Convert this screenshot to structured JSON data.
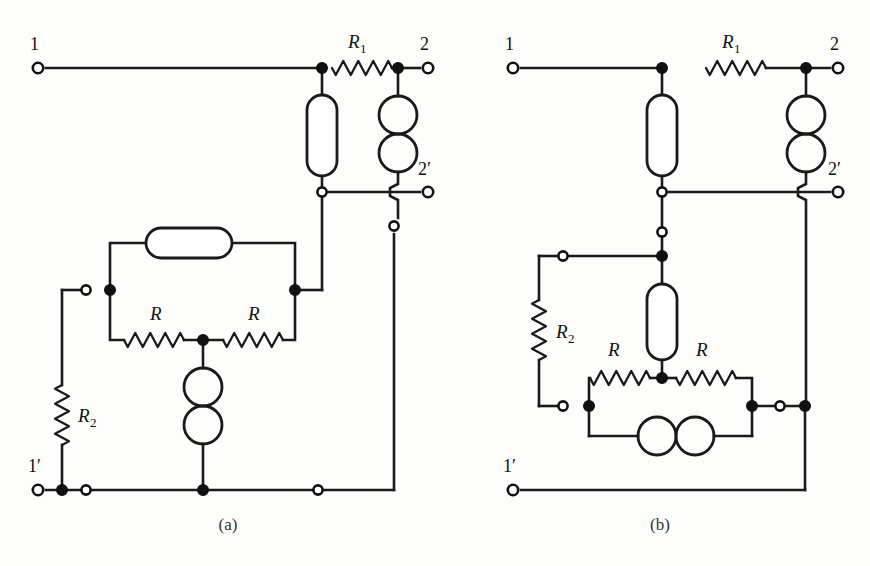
{
  "figure": {
    "background_color": "#fdfdfc",
    "ink_color": "#1a1a1a",
    "width": 870,
    "height": 566,
    "panels": [
      {
        "id": "panel-a",
        "caption": "(a)",
        "caption_x": 228,
        "caption_y": 530,
        "terminals": [
          {
            "name": "terminal-1",
            "label": "1",
            "cx": 38,
            "cy": 68,
            "label_x": 30,
            "label_y": 50
          },
          {
            "name": "terminal-2",
            "label": "2",
            "cx": 428,
            "cy": 68,
            "label_x": 420,
            "label_y": 50
          },
          {
            "name": "terminal-2p",
            "label": "2′",
            "cx": 428,
            "cy": 192,
            "label_x": 418,
            "label_y": 175
          },
          {
            "name": "terminal-1p",
            "label": "1′",
            "cx": 38,
            "cy": 490,
            "label_x": 28,
            "label_y": 472
          }
        ],
        "components": [
          {
            "name": "resistor-r1",
            "type": "resistor",
            "orientation": "h",
            "x1": 332,
            "y1": 68,
            "x2": 392,
            "y2": 68,
            "label": "R",
            "sub": "1",
            "label_x": 348,
            "label_y": 48
          },
          {
            "name": "inductor-upper",
            "type": "inductor-stadium",
            "orientation": "v",
            "cx": 322,
            "y1": 95,
            "y2": 176,
            "w": 30
          },
          {
            "name": "capacitor-upper",
            "type": "capacitor-double-circle",
            "orientation": "v",
            "cx": 398,
            "y1": 96,
            "y2": 172
          },
          {
            "name": "inductor-middle",
            "type": "inductor-stadium",
            "orientation": "h",
            "cy": 243,
            "x1": 146,
            "x2": 232,
            "w": 30
          },
          {
            "name": "resistor-r-left",
            "type": "resistor",
            "orientation": "h",
            "x1": 124,
            "y1": 340,
            "x2": 184,
            "y2": 340,
            "label": "R",
            "sub": "",
            "label_x": 150,
            "label_y": 320
          },
          {
            "name": "resistor-r-right",
            "type": "resistor",
            "orientation": "h",
            "x1": 223,
            "y1": 340,
            "x2": 283,
            "y2": 340,
            "label": "R",
            "sub": "",
            "label_x": 248,
            "label_y": 320
          },
          {
            "name": "resistor-r2",
            "type": "resistor",
            "orientation": "v",
            "x1": 62,
            "y1": 385,
            "x2": 62,
            "y2": 445,
            "label": "R",
            "sub": "2",
            "label_x": 78,
            "label_y": 422
          },
          {
            "name": "capacitor-lower",
            "type": "capacitor-double-circle",
            "orientation": "v",
            "cx": 203,
            "y1": 368,
            "y2": 444
          }
        ],
        "nodes": [
          {
            "name": "node-a-top-left-junction",
            "type": "filled",
            "cx": 322,
            "cy": 68
          },
          {
            "name": "node-a-top-right-junction",
            "type": "filled",
            "cx": 398,
            "cy": 68
          },
          {
            "name": "node-a-mid-left-open",
            "type": "open",
            "cx": 322,
            "cy": 192
          },
          {
            "name": "node-a-2p-stub-open",
            "type": "open",
            "cx": 394,
            "cy": 226
          },
          {
            "name": "node-a-bridge-left-open",
            "type": "open",
            "cx": 86,
            "cy": 290
          },
          {
            "name": "node-a-bridge-left-dot",
            "type": "filled",
            "cx": 110,
            "cy": 290
          },
          {
            "name": "node-a-bridge-right-dot",
            "type": "filled",
            "cx": 295,
            "cy": 290
          },
          {
            "name": "node-a-center-dot",
            "type": "filled",
            "cx": 203,
            "cy": 340
          },
          {
            "name": "node-a-bottom-left-dot",
            "type": "filled",
            "cx": 62,
            "cy": 490
          },
          {
            "name": "node-a-bottom-left-open",
            "type": "open",
            "cx": 86,
            "cy": 490
          },
          {
            "name": "node-a-bottom-center-dot",
            "type": "filled",
            "cx": 203,
            "cy": 490
          },
          {
            "name": "node-a-bottom-right-open",
            "type": "open",
            "cx": 318,
            "cy": 490
          }
        ],
        "wires": [
          {
            "name": "wire-a-top-rail-in",
            "d": "M 46 68 L 322 68"
          },
          {
            "name": "wire-a-r1-to-node2",
            "d": "M 392 68 L 420 68"
          },
          {
            "name": "wire-a-node1-to-ind",
            "d": "M 322 68 L 322 95"
          },
          {
            "name": "wire-a-node2-to-cap",
            "d": "M 398 68 L 398 96"
          },
          {
            "name": "wire-a-ind-to-open",
            "d": "M 322 176 L 322 192"
          },
          {
            "name": "wire-a-2p-rail",
            "d": "M 322 192 L 420 192"
          },
          {
            "name": "wire-a-cap-hop",
            "d": "M 398 172 L 398 184 L 390 188 L 390 196 L 398 200 L 398 218"
          },
          {
            "name": "wire-a-2p-stub-down",
            "d": "M 394 234 L 394 490"
          },
          {
            "name": "wire-a-left-down",
            "d": "M 322 192 L 322 290"
          },
          {
            "name": "wire-a-left-to-bridge",
            "d": "M 295 290 L 322 290"
          },
          {
            "name": "wire-a-bridge-top-left",
            "d": "M 110 290 L 110 243 L 146 243"
          },
          {
            "name": "wire-a-bridge-top-right",
            "d": "M 232 243 L 295 243 L 295 290"
          },
          {
            "name": "wire-a-bridge-lo-left",
            "d": "M 110 290 L 110 340 L 124 340"
          },
          {
            "name": "wire-a-bridge-lo-right",
            "d": "M 283 340 L 295 340 L 295 290"
          },
          {
            "name": "wire-a-r-mid",
            "d": "M 184 340 L 223 340"
          },
          {
            "name": "wire-a-center-to-cap",
            "d": "M 203 340 L 203 368"
          },
          {
            "name": "wire-a-cap-to-bottom",
            "d": "M 203 444 L 203 490"
          },
          {
            "name": "wire-a-left-open-stub",
            "d": "M 62 290 L 86 290"
          },
          {
            "name": "wire-a-r2-top",
            "d": "M 62 290 L 62 385"
          },
          {
            "name": "wire-a-r2-bottom",
            "d": "M 62 445 L 62 490"
          },
          {
            "name": "wire-a-bottom-rail",
            "d": "M 46 490 L 394 490"
          }
        ]
      },
      {
        "id": "panel-b",
        "caption": "(b)",
        "caption_x": 660,
        "caption_y": 530,
        "terminals": [
          {
            "name": "terminal-1",
            "label": "1",
            "cx": 513,
            "cy": 68,
            "label_x": 505,
            "label_y": 50
          },
          {
            "name": "terminal-2",
            "label": "2",
            "cx": 838,
            "cy": 68,
            "label_x": 830,
            "label_y": 50
          },
          {
            "name": "terminal-2p",
            "label": "2′",
            "cx": 838,
            "cy": 192,
            "label_x": 828,
            "label_y": 175
          },
          {
            "name": "terminal-1p",
            "label": "1′",
            "cx": 513,
            "cy": 490,
            "label_x": 503,
            "label_y": 472
          }
        ],
        "components": [
          {
            "name": "resistor-r1",
            "type": "resistor",
            "orientation": "h",
            "x1": 706,
            "y1": 68,
            "x2": 766,
            "y2": 68,
            "label": "R",
            "sub": "1",
            "label_x": 722,
            "label_y": 48
          },
          {
            "name": "inductor-upper",
            "type": "inductor-stadium",
            "orientation": "v",
            "cx": 662,
            "y1": 95,
            "y2": 176,
            "w": 30
          },
          {
            "name": "capacitor-upper",
            "type": "capacitor-double-circle",
            "orientation": "v",
            "cx": 806,
            "y1": 96,
            "y2": 172
          },
          {
            "name": "inductor-lower",
            "type": "inductor-stadium",
            "orientation": "v",
            "cx": 662,
            "y1": 284,
            "y2": 360,
            "w": 30
          },
          {
            "name": "resistor-r-left",
            "type": "resistor",
            "orientation": "h",
            "x1": 590,
            "y1": 378,
            "x2": 650,
            "y2": 378,
            "label": "R",
            "sub": "",
            "label_x": 608,
            "label_y": 356
          },
          {
            "name": "resistor-r-right",
            "type": "resistor",
            "orientation": "h",
            "x1": 676,
            "y1": 378,
            "x2": 736,
            "y2": 378,
            "label": "R",
            "sub": "",
            "label_x": 696,
            "label_y": 356
          },
          {
            "name": "resistor-r2",
            "type": "resistor",
            "orientation": "v",
            "x1": 539,
            "y1": 300,
            "x2": 539,
            "y2": 360,
            "label": "R",
            "sub": "2",
            "label_x": 556,
            "label_y": 338
          },
          {
            "name": "capacitor-lower",
            "type": "capacitor-double-circle",
            "orientation": "h",
            "cy": 436,
            "x1": 638,
            "x2": 714
          }
        ],
        "nodes": [
          {
            "name": "node-b-top-left-junction",
            "type": "filled",
            "cx": 662,
            "cy": 68
          },
          {
            "name": "node-b-top-right-junction",
            "type": "filled",
            "cx": 806,
            "cy": 68
          },
          {
            "name": "node-b-mid-open",
            "type": "open",
            "cx": 662,
            "cy": 192
          },
          {
            "name": "node-b-stub-open",
            "type": "open",
            "cx": 662,
            "cy": 232
          },
          {
            "name": "node-b-center-top-dot",
            "type": "filled",
            "cx": 662,
            "cy": 256
          },
          {
            "name": "node-b-r2-top-open",
            "type": "open",
            "cx": 563,
            "cy": 256
          },
          {
            "name": "node-b-center-dot",
            "type": "filled",
            "cx": 662,
            "cy": 378
          },
          {
            "name": "node-b-r2-bot-open",
            "type": "open",
            "cx": 563,
            "cy": 406
          },
          {
            "name": "node-b-left-rail-dot",
            "type": "filled",
            "cx": 589,
            "cy": 406
          },
          {
            "name": "node-b-right-rail-dot",
            "type": "filled",
            "cx": 752,
            "cy": 406
          },
          {
            "name": "node-b-right-open",
            "type": "open",
            "cx": 780,
            "cy": 406
          },
          {
            "name": "node-b-far-right-dot",
            "type": "filled",
            "cx": 805,
            "cy": 406
          }
        ],
        "wires": [
          {
            "name": "wire-b-top-rail-in",
            "d": "M 521 68 L 662 68"
          },
          {
            "name": "wire-b-r1-to-node2",
            "d": "M 766 68 L 830 68"
          },
          {
            "name": "wire-b-node1-to-ind",
            "d": "M 662 68 L 662 95"
          },
          {
            "name": "wire-b-node2-to-cap",
            "d": "M 806 68 L 806 96"
          },
          {
            "name": "wire-b-ind-to-open",
            "d": "M 662 176 L 662 192"
          },
          {
            "name": "wire-b-2p-rail",
            "d": "M 662 192 L 830 192"
          },
          {
            "name": "wire-b-cap-hop",
            "d": "M 806 172 L 806 184 L 798 188 L 798 196 L 806 200 L 806 406"
          },
          {
            "name": "wire-b-open-to-stub",
            "d": "M 662 192 L 662 232"
          },
          {
            "name": "wire-b-stub-to-dot",
            "d": "M 662 232 L 662 256"
          },
          {
            "name": "wire-b-dot-to-ind2",
            "d": "M 662 256 L 662 284"
          },
          {
            "name": "wire-b-r2-top-lead",
            "d": "M 563 256 L 662 256"
          },
          {
            "name": "wire-b-r2-up",
            "d": "M 539 256 L 539 300"
          },
          {
            "name": "wire-b-r2-up-elbow",
            "d": "M 539 256 L 563 256"
          },
          {
            "name": "wire-b-r2-down",
            "d": "M 539 360 L 539 406"
          },
          {
            "name": "wire-b-r2-bot-elbow",
            "d": "M 539 406 L 563 406"
          },
          {
            "name": "wire-b-ind2-to-center",
            "d": "M 662 360 L 662 378"
          },
          {
            "name": "wire-b-r-mid",
            "d": "M 650 378 L 676 378"
          },
          {
            "name": "wire-b-bridge-left",
            "d": "M 590 378 L 589 378 L 589 436"
          },
          {
            "name": "wire-b-bridge-right",
            "d": "M 736 378 L 752 378 L 752 436"
          },
          {
            "name": "wire-b-cap-left-lead",
            "d": "M 589 436 L 638 436"
          },
          {
            "name": "wire-b-cap-right-lead",
            "d": "M 714 436 L 752 436"
          },
          {
            "name": "wire-b-rail-right",
            "d": "M 752 406 L 805 406"
          },
          {
            "name": "wire-b-right-down",
            "d": "M 805 406 L 805 490"
          },
          {
            "name": "wire-b-bottom-rail",
            "d": "M 521 490 L 805 490"
          }
        ]
      }
    ]
  }
}
